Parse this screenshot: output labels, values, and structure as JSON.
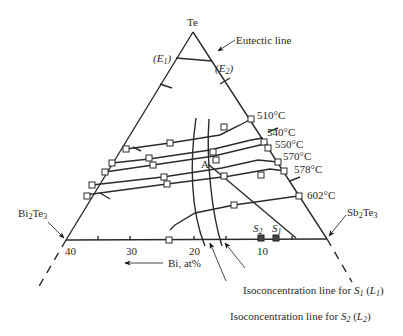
{
  "diagram": {
    "type": "ternary-phase-diagram-section",
    "apex_label": "Te",
    "corner_left": {
      "base": "Bi",
      "sub1": "2",
      "mid": "Te",
      "sub2": "3"
    },
    "corner_right": {
      "base": "Sb",
      "sub1": "2",
      "mid": "Te",
      "sub2": "3"
    },
    "eutectic_label": "Eutectic line",
    "e1_label": {
      "open": "(",
      "letter": "E",
      "sub": "1",
      "close": ")"
    },
    "e2_label": {
      "open": "(",
      "letter": "E",
      "sub": "2",
      "close": ")"
    },
    "axis": {
      "ticks": [
        "40",
        "30",
        "20",
        "10"
      ],
      "label": "Bi, at%",
      "arrow": "←"
    },
    "isotherms": [
      "510°C",
      "540°C",
      "550°C",
      "570°C",
      "578°C",
      "602°C"
    ],
    "point_a": "A",
    "points_s": [
      {
        "letter": "S",
        "sub": "2"
      },
      {
        "letter": "S",
        "sub": "1"
      }
    ],
    "callouts": {
      "l1": {
        "text": "Isoconcentration line for ",
        "letter": "S",
        "sub": "1",
        "paren_open": " (",
        "l": "L",
        "lsub": "1",
        "paren_close": ")"
      },
      "l2": {
        "text": "Isoconcentration line for ",
        "letter": "S",
        "sub": "2",
        "paren_open": " (",
        "l": "L",
        "lsub": "2",
        "paren_close": ")"
      }
    }
  }
}
